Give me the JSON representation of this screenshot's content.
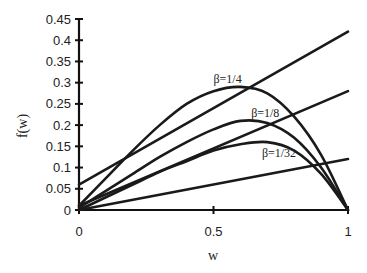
{
  "chart_data": {
    "type": "line",
    "title": "",
    "xlabel": "w",
    "ylabel": "f(w)",
    "xlim": [
      0,
      1
    ],
    "ylim": [
      0,
      0.45
    ],
    "x_ticks": [
      "0",
      "0.5",
      "1"
    ],
    "y_ticks": [
      "0",
      "0.05",
      "0.1",
      "0.15",
      "0.2",
      "0.25",
      "0.3",
      "0.35",
      "0.4",
      "0.45"
    ],
    "grid": false,
    "legend": "none (inline annotations)",
    "series": [
      {
        "name": "β=1/4",
        "kind": "curve",
        "x": [
          0,
          0.1,
          0.2,
          0.3,
          0.4,
          0.5,
          0.6,
          0.7,
          0.8,
          0.9,
          1.0
        ],
        "y": [
          0.01,
          0.075,
          0.14,
          0.2,
          0.25,
          0.28,
          0.29,
          0.275,
          0.22,
          0.13,
          0.0
        ]
      },
      {
        "name": "β=1/8",
        "kind": "curve",
        "x": [
          0,
          0.1,
          0.2,
          0.3,
          0.4,
          0.5,
          0.6,
          0.7,
          0.8,
          0.9,
          1.0
        ],
        "y": [
          0.005,
          0.045,
          0.085,
          0.125,
          0.16,
          0.19,
          0.21,
          0.205,
          0.17,
          0.1,
          0.0
        ]
      },
      {
        "name": "β=1/32",
        "kind": "curve",
        "x": [
          0,
          0.1,
          0.2,
          0.3,
          0.4,
          0.5,
          0.6,
          0.7,
          0.8,
          0.9,
          1.0
        ],
        "y": [
          0.0,
          0.03,
          0.06,
          0.09,
          0.115,
          0.14,
          0.155,
          0.16,
          0.14,
          0.085,
          0.0
        ]
      },
      {
        "name": "line-upper",
        "kind": "straight",
        "x": [
          0,
          1
        ],
        "y": [
          0.06,
          0.42
        ]
      },
      {
        "name": "line-middle",
        "kind": "straight",
        "x": [
          0,
          1
        ],
        "y": [
          0.01,
          0.28
        ]
      },
      {
        "name": "line-lower",
        "kind": "straight",
        "x": [
          0,
          1
        ],
        "y": [
          0.0,
          0.12
        ]
      }
    ],
    "annotations": [
      {
        "text": "β=1/4",
        "x": 0.5,
        "y": 0.3
      },
      {
        "text": "β=1/8",
        "x": 0.64,
        "y": 0.22
      },
      {
        "text": "β=1/32",
        "x": 0.68,
        "y": 0.125
      }
    ]
  }
}
